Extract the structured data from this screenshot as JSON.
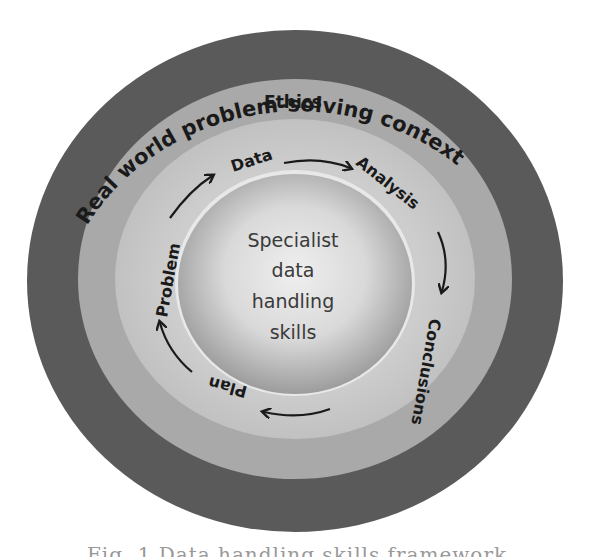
{
  "diagram": {
    "title": "Data handling skills framework",
    "rings": {
      "outer": {
        "label": "Real world problem-solving context",
        "color": "#5a5a5a"
      },
      "ethics": {
        "label": "Ethics",
        "color": "#a9a9a9"
      },
      "cycle": {
        "color": "#c6c6c6"
      },
      "core": {
        "label_lines": [
          "Specialist",
          "data",
          "handling",
          "skills"
        ],
        "color_center": "#ececec",
        "color_edge": "#9c9c9c"
      }
    },
    "cycle_steps": [
      "Problem",
      "Data",
      "Analysis",
      "Conclusions",
      "Plan"
    ],
    "cycle_arrows": [
      {
        "from": "Problem",
        "to": "Data"
      },
      {
        "from": "Data",
        "to": "Analysis"
      },
      {
        "from": "Analysis",
        "to": "Conclusions"
      },
      {
        "from": "Conclusions",
        "to": "Plan"
      },
      {
        "from": "Plan",
        "to": "Problem"
      }
    ]
  },
  "caption": {
    "text": "Fig. 1  Data handling skills framework",
    "clipped": true
  }
}
